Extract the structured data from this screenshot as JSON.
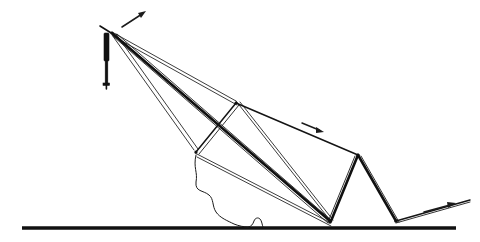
{
  "diagram": {
    "background_color": "#ffffff",
    "line_color": "#1a1a1a",
    "ground_color": "#111111",
    "canvas": {
      "width": 480,
      "height": 242
    }
  },
  "ground": {
    "label": "ground-line",
    "x1": 22,
    "y1": 228,
    "x2": 456,
    "y2": 228
  },
  "mast": {
    "label": "vertical-mast",
    "top_x": 107,
    "top_y": 30,
    "bottom_x": 106,
    "bottom_y": 88,
    "hub_x": 112,
    "hub_y": 33
  },
  "nodes": [
    {
      "name": "mast-head-hub",
      "x": 112,
      "y": 33
    },
    {
      "name": "upper-linkage-joint",
      "x": 236,
      "y": 103
    },
    {
      "name": "lower-linkage-joint",
      "x": 196,
      "y": 152
    },
    {
      "name": "ground-anchor-left",
      "x": 330,
      "y": 222
    },
    {
      "name": "aframe-apex",
      "x": 358,
      "y": 155
    },
    {
      "name": "ground-anchor-right",
      "x": 396,
      "y": 221
    },
    {
      "name": "ramp-tip",
      "x": 470,
      "y": 200
    }
  ],
  "arrows": [
    {
      "name": "mast-rotation-arrow",
      "x1": 122,
      "y1": 27,
      "x2": 145,
      "y2": 12,
      "direction": "up-right"
    },
    {
      "name": "boom-travel-arrow",
      "x1": 303,
      "y1": 123,
      "x2": 323,
      "y2": 131,
      "direction": "down-right"
    },
    {
      "name": "ramp-extend-arrow",
      "x1": 425,
      "y1": 211,
      "x2": 455,
      "y2": 203,
      "direction": "up-right"
    }
  ],
  "members": {
    "bold_boom": {
      "name": "main-boom",
      "from": "mast-head-hub",
      "to": "ground-anchor-left"
    },
    "upper_cable_pair": {
      "name": "upper-cable-pair",
      "from": "mast-head-hub",
      "to": "upper-linkage-joint"
    },
    "lower_cable_pair": {
      "name": "lower-cable-pair",
      "from": "mast-head-hub",
      "to": "lower-linkage-joint"
    },
    "long_cable_pair": {
      "name": "long-cable-pair",
      "from": "mast-head-hub",
      "to": "ground-anchor-left"
    },
    "link_bar": {
      "name": "parallel-link-bar",
      "from": "lower-linkage-joint",
      "to": "upper-linkage-joint"
    },
    "top_chord": {
      "name": "top-chord",
      "from": "upper-linkage-joint",
      "to": "aframe-apex"
    },
    "aframe_left_leg": {
      "name": "aframe-left-leg",
      "from": "aframe-apex",
      "to": "ground-anchor-left"
    },
    "aframe_right_leg": {
      "name": "aframe-right-leg",
      "from": "aframe-apex",
      "to": "ground-anchor-right"
    },
    "ramp": {
      "name": "ramp-member",
      "from": "ground-anchor-right",
      "to": "ramp-tip"
    },
    "net_curve": {
      "name": "draped-net-curve",
      "from": "lower-linkage-joint",
      "to": "ground"
    }
  }
}
